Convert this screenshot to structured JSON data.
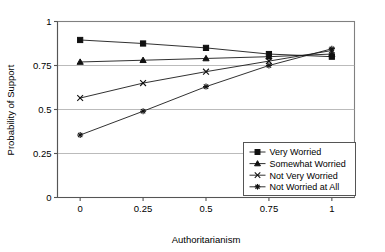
{
  "chart_data": {
    "type": "line",
    "title": "",
    "xlabel": "Authoritarianism",
    "ylabel": "Probability of Support",
    "x": [
      0,
      0.25,
      0.5,
      0.75,
      1
    ],
    "xtick_labels": [
      "0",
      "0.25",
      "0.5",
      "0.75",
      "1"
    ],
    "ytick_labels": [
      "0",
      "0.25",
      "0.5",
      "0.75",
      "1"
    ],
    "xlim": [
      -0.09,
      1.09
    ],
    "ylim": [
      0,
      1
    ],
    "grid": "horizontal",
    "legend_position": "bottom-right",
    "series": [
      {
        "name": "Very Worried",
        "marker": "square",
        "values": [
          0.895,
          0.875,
          0.85,
          0.815,
          0.8
        ]
      },
      {
        "name": "Somewhat Worried",
        "marker": "triangle",
        "values": [
          0.77,
          0.78,
          0.79,
          0.8,
          0.815
        ]
      },
      {
        "name": "Not Very Worried",
        "marker": "x",
        "values": [
          0.565,
          0.65,
          0.715,
          0.775,
          0.835
        ]
      },
      {
        "name": "Not Worried at All",
        "marker": "star",
        "values": [
          0.355,
          0.49,
          0.63,
          0.75,
          0.845
        ]
      }
    ]
  },
  "legend": {
    "entries": [
      {
        "label": "Very Worried",
        "marker": "square"
      },
      {
        "label": "Somewhat Worried",
        "marker": "triangle"
      },
      {
        "label": "Not Very Worried",
        "marker": "x"
      },
      {
        "label": "Not Worried at All",
        "marker": "star"
      }
    ]
  }
}
